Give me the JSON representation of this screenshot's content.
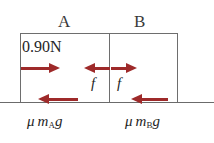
{
  "figure": {
    "title_a": "A",
    "title_b": "B",
    "applied_force": "0.90N",
    "friction_internal_a": "f",
    "friction_internal_b": "f",
    "ground_friction_a_mu": "μ",
    "ground_friction_a_m": "m",
    "ground_friction_a_sub": "A",
    "ground_friction_a_g": "g",
    "ground_friction_b_mu": "μ",
    "ground_friction_b_m": "m",
    "ground_friction_b_sub": "B",
    "ground_friction_b_g": "g",
    "colors": {
      "arrow": "#9e2a2a",
      "box_outline": "#6e6e6e",
      "ground": "#6b6b6b",
      "background": "#ffffff",
      "text": "#262626"
    }
  }
}
